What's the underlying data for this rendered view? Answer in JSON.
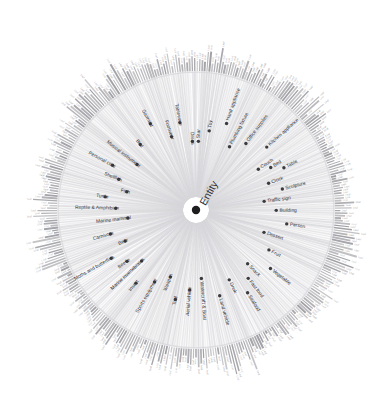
{
  "figure": {
    "kind": "radial-dendrogram",
    "root_label": "Entity",
    "background_color": "#ffffff",
    "edge_color": "#d6d6da",
    "ring_bar_color": "#9a9aa0",
    "node_dot_color": "#3a3a3f",
    "root_dot_color": "#1d1d20",
    "node_label_color": "#2e2e32",
    "leaf_label_color": "#8e8e93",
    "center": {
      "x": 196,
      "y": 210
    },
    "inner_radius": 12,
    "ring_inner_radius": 139,
    "ring_outer_radius": 151,
    "leaf_count": 272,
    "top_artifact_text": "· — ·· · ·· — — — · · ·· ··"
  },
  "chart_data": {
    "type": "radial-dendrogram",
    "title": "",
    "root": "Entity",
    "leaf_count": 272,
    "ring_bar_value_range": [
      3,
      34
    ],
    "categories": [
      {
        "label": "Toy",
        "angle_deg": -64.0,
        "leaf_span": 11,
        "bar_peak": 21
      },
      {
        "label": "Hand appliance",
        "angle_deg": -55.0,
        "leaf_span": 9,
        "bar_peak": 17
      },
      {
        "label": "Plumbing fixture",
        "angle_deg": -47.0,
        "leaf_span": 8,
        "bar_peak": 14
      },
      {
        "label": "Office supplies",
        "angle_deg": -39.5,
        "leaf_span": 10,
        "bar_peak": 19
      },
      {
        "label": "Kitchen appliance",
        "angle_deg": -30.0,
        "leaf_span": 13,
        "bar_peak": 24
      },
      {
        "label": "Couch",
        "angle_deg": -21.0,
        "leaf_span": 4,
        "bar_peak": 10
      },
      {
        "label": "Bed",
        "angle_deg": -16.0,
        "leaf_span": 3,
        "bar_peak": 8
      },
      {
        "label": "Table",
        "angle_deg": -11.5,
        "leaf_span": 5,
        "bar_peak": 12
      },
      {
        "label": "Clock",
        "angle_deg": -2.0,
        "leaf_span": 6,
        "bar_peak": 13
      },
      {
        "label": "Sculpture",
        "angle_deg": 7.0,
        "leaf_span": 7,
        "bar_peak": 15
      },
      {
        "label": "Traffic sign",
        "angle_deg": 16.0,
        "leaf_span": 6,
        "bar_peak": 12
      },
      {
        "label": "Building",
        "angle_deg": 24.0,
        "leaf_span": 9,
        "bar_peak": 18
      },
      {
        "label": "Person",
        "angle_deg": 31.0,
        "leaf_span": 8,
        "bar_peak": 22
      },
      {
        "label": "Dessert",
        "angle_deg": 43.0,
        "leaf_span": 11,
        "bar_peak": 25
      },
      {
        "label": "Fruit",
        "angle_deg": 52.0,
        "leaf_span": 10,
        "bar_peak": 20
      },
      {
        "label": "Vegetable",
        "angle_deg": 60.0,
        "leaf_span": 9,
        "bar_peak": 18
      },
      {
        "label": "Snack",
        "angle_deg": 67.0,
        "leaf_span": 7,
        "bar_peak": 15
      },
      {
        "label": "Fast food",
        "angle_deg": 74.0,
        "leaf_span": 6,
        "bar_peak": 13
      },
      {
        "label": "Seafood",
        "angle_deg": 81.0,
        "leaf_span": 5,
        "bar_peak": 11
      },
      {
        "label": "Drink",
        "angle_deg": 88.0,
        "leaf_span": 8,
        "bar_peak": 16
      },
      {
        "label": "Land vehicle",
        "angle_deg": 97.0,
        "leaf_span": 12,
        "bar_peak": 26
      },
      {
        "label": "Watercraft & Boat",
        "angle_deg": 106.0,
        "leaf_span": 10,
        "bar_peak": 20
      },
      {
        "label": "Aerial vehicle",
        "angle_deg": 114.0,
        "leaf_span": 8,
        "bar_peak": 17
      },
      {
        "label": "Tool",
        "angle_deg": 122.0,
        "leaf_span": 9,
        "bar_peak": 19
      },
      {
        "label": "Weapon",
        "angle_deg": 129.0,
        "leaf_span": 7,
        "bar_peak": 15
      },
      {
        "label": "Sports equipment",
        "angle_deg": 137.0,
        "leaf_span": 11,
        "bar_peak": 23
      },
      {
        "label": "Insect",
        "angle_deg": 147.0,
        "leaf_span": 8,
        "bar_peak": 18
      },
      {
        "label": "Marine invertebrates",
        "angle_deg": 154.0,
        "leaf_span": 7,
        "bar_peak": 14
      },
      {
        "label": "Beetle",
        "angle_deg": 160.0,
        "leaf_span": 6,
        "bar_peak": 12
      },
      {
        "label": "Moths and butterflies",
        "angle_deg": 166.0,
        "leaf_span": 8,
        "bar_peak": 16
      },
      {
        "label": "Bear",
        "angle_deg": 172.0,
        "leaf_span": 4,
        "bar_peak": 10
      },
      {
        "label": "Carnivore",
        "angle_deg": 179.0,
        "leaf_span": 12,
        "bar_peak": 24
      },
      {
        "label": "Marine mammal",
        "angle_deg": 189.0,
        "leaf_span": 6,
        "bar_peak": 13
      },
      {
        "label": "Reptile & Amphibian",
        "angle_deg": 196.0,
        "leaf_span": 10,
        "bar_peak": 21
      },
      {
        "label": "Turtle",
        "angle_deg": 200.0,
        "leaf_span": 4,
        "bar_peak": 9
      },
      {
        "label": "Fish",
        "angle_deg": 205.0,
        "leaf_span": 9,
        "bar_peak": 19
      },
      {
        "label": "Shellfish",
        "angle_deg": 209.0,
        "leaf_span": 5,
        "bar_peak": 11
      },
      {
        "label": "Personal care",
        "angle_deg": 213.0,
        "leaf_span": 8,
        "bar_peak": 17
      },
      {
        "label": "Musical instrument",
        "angle_deg": 222.0,
        "leaf_span": 11,
        "bar_peak": 22
      },
      {
        "label": "Bird",
        "angle_deg": 232.0,
        "leaf_span": 13,
        "bar_peak": 27
      },
      {
        "label": "Garment",
        "angle_deg": 243.0,
        "leaf_span": 12,
        "bar_peak": 25
      },
      {
        "label": "Footwear",
        "angle_deg": 251.0,
        "leaf_span": 7,
        "bar_peak": 15
      },
      {
        "label": "Tableware",
        "angle_deg": 258.0,
        "leaf_span": 9,
        "bar_peak": 18
      },
      {
        "label": "Dress",
        "angle_deg": 265.0,
        "leaf_span": 6,
        "bar_peak": 13
      },
      {
        "label": "Star",
        "angle_deg": -71.0,
        "leaf_span": 4,
        "bar_peak": 11
      }
    ]
  }
}
